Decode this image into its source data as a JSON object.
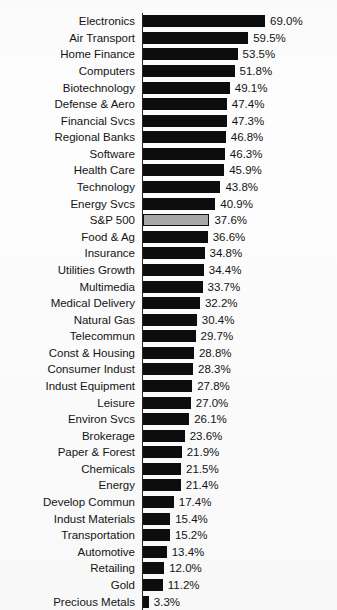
{
  "chart_data": {
    "type": "bar",
    "orientation": "horizontal",
    "title": "Sector Returns",
    "subtitle": "",
    "xlabel": "",
    "ylabel": "",
    "grid": false,
    "legend": "none",
    "xlim": [
      0,
      69
    ],
    "value_suffix": "%",
    "highlight_category": "S&P 500",
    "colors": {
      "bar": "#0d0d0d",
      "highlight_bar": "#a8a8a8",
      "highlight_border": "#0d0d0d",
      "text": "#141414",
      "background": "#fdfdfd"
    },
    "categories": [
      "Electronics",
      "Air Transport",
      "Home Finance",
      "Computers",
      "Biotechnology",
      "Defense & Aero",
      "Financial Svcs",
      "Regional Banks",
      "Software",
      "Health Care",
      "Technology",
      "Energy Svcs",
      "S&P 500",
      "Food & Ag",
      "Insurance",
      "Utilities Growth",
      "Multimedia",
      "Medical Delivery",
      "Natural Gas",
      "Telecommun",
      "Const & Housing",
      "Consumer Indust",
      "Indust Equipment",
      "Leisure",
      "Environ Svcs",
      "Brokerage",
      "Paper & Forest",
      "Chemicals",
      "Energy",
      "Develop Commun",
      "Indust Materials",
      "Transportation",
      "Automotive",
      "Retailing",
      "Gold",
      "Precious Metals"
    ],
    "values": [
      69.0,
      59.5,
      53.5,
      51.8,
      49.1,
      47.4,
      47.3,
      46.8,
      46.3,
      45.9,
      43.8,
      40.9,
      37.6,
      36.6,
      34.8,
      34.4,
      33.7,
      32.2,
      30.4,
      29.7,
      28.8,
      28.3,
      27.8,
      27.0,
      26.1,
      23.6,
      21.9,
      21.5,
      21.4,
      17.4,
      15.4,
      15.2,
      13.4,
      12.0,
      11.2,
      3.3
    ],
    "value_labels": [
      "69.0%",
      "59.5%",
      "53.5%",
      "51.8%",
      "49.1%",
      "47.4%",
      "47.3%",
      "46.8%",
      "46.3%",
      "45.9%",
      "43.8%",
      "40.9%",
      "37.6%",
      "36.6%",
      "34.8%",
      "34.4%",
      "33.7%",
      "32.2%",
      "30.4%",
      "29.7%",
      "28.8%",
      "28.3%",
      "27.8%",
      "27.0%",
      "26.1%",
      "23.6%",
      "21.9%",
      "21.5%",
      "21.4%",
      "17.4%",
      "15.4%",
      "15.2%",
      "13.4%",
      "12.0%",
      "11.2%",
      "3.3%"
    ]
  }
}
